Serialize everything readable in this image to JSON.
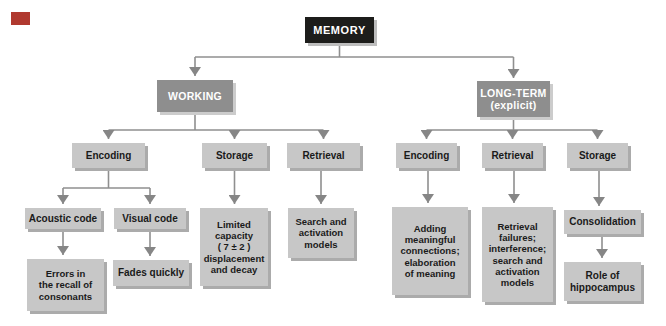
{
  "colors": {
    "corner_mark": "#b0392f",
    "root_box_bg": "#1d1d1b",
    "branch_box_bg": "#8e8e8e",
    "leaf_box_bg": "#c7c7c7",
    "connector": "#8f8f8f",
    "connector_arrow": "#868686"
  },
  "nodes": {
    "memory": {
      "label": "MEMORY"
    },
    "working": {
      "label": "WORKING"
    },
    "long_term": {
      "label": "LONG-TERM\n(explicit)"
    },
    "working_encoding": {
      "label": "Encoding"
    },
    "working_storage": {
      "label": "Storage"
    },
    "working_retrieval": {
      "label": "Retrieval"
    },
    "acoustic_code": {
      "label": "Acoustic code"
    },
    "visual_code": {
      "label": "Visual code"
    },
    "errors_recall": {
      "label": "Errors in\nthe recall of\nconsonants"
    },
    "fades_quickly": {
      "label": "Fades quickly"
    },
    "limited_capacity": {
      "label": "Limited\ncapacity\n( 7 ± 2 )\ndisplacement\nand decay"
    },
    "search_activation": {
      "label": "Search and\nactivation\nmodels"
    },
    "longterm_encoding": {
      "label": "Encoding"
    },
    "longterm_retrieval": {
      "label": "Retrieval"
    },
    "longterm_storage": {
      "label": "Storage"
    },
    "adding_meaningful": {
      "label": "Adding\nmeaningful\nconnections;\nelaboration\nof meaning"
    },
    "retrieval_failures": {
      "label": "Retrieval\nfailures;\ninterference;\nsearch and\nactivation\nmodels"
    },
    "consolidation": {
      "label": "Consolidation"
    },
    "role_hippocampus": {
      "label": "Role of\nhippocampus"
    }
  }
}
